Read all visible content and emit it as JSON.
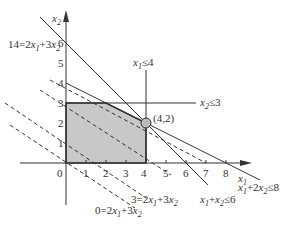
{
  "diagram": {
    "axes": {
      "x_label": "x1",
      "y_label": "x2",
      "origin_label": "0",
      "x_ticks": [
        "1",
        "2",
        "3",
        "4",
        "5",
        "6",
        "7",
        "8"
      ],
      "y_ticks": [
        "1",
        "2",
        "3",
        "4",
        "5",
        "6"
      ]
    },
    "constraints": [
      {
        "label": "x1≤4",
        "text_main": "x",
        "sub": "1",
        "rest": "≤4"
      },
      {
        "label": "x2≤3",
        "text_main": "x",
        "sub": "2",
        "rest": "≤3"
      },
      {
        "label": "x1+2x2≤8"
      },
      {
        "label": "x1+x2≤6"
      }
    ],
    "objective_lines": [
      {
        "label": "0=2x1+3x2",
        "value": 0
      },
      {
        "label": "3=2x1+3x2",
        "value": 3
      },
      {
        "label": "14=2x1+3x2",
        "value": 14
      }
    ],
    "optimal_point": {
      "label": "(4,2)",
      "x": 4,
      "y": 2
    },
    "feasible_region": {
      "vertices": [
        [
          0,
          0
        ],
        [
          4,
          0
        ],
        [
          4,
          2
        ],
        [
          2,
          3
        ],
        [
          0,
          3
        ]
      ],
      "fill": "#c8c8c8"
    },
    "colors": {
      "line": "#333333",
      "region": "#c8c8c8",
      "point": "#bbbbbb"
    }
  }
}
